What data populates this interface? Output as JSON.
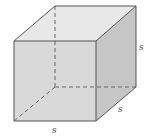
{
  "figure": {
    "type": "cube",
    "labels": {
      "height": "s",
      "depth": "s",
      "width": "s"
    },
    "colors": {
      "front_face": "#d8d8d8",
      "top_face": "#e8e8e8",
      "right_face": "#c4c4c4",
      "edge": "#555555",
      "hidden_edge": "#666666",
      "label": "#444444"
    }
  }
}
